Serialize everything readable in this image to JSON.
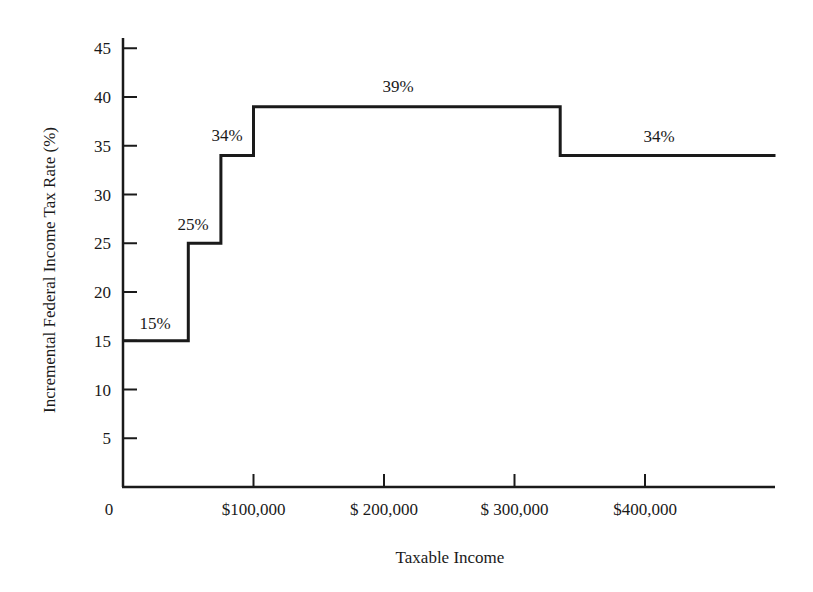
{
  "chart_data": {
    "type": "line",
    "subtype": "step",
    "title": "",
    "xlabel": "Taxable Income",
    "ylabel": "Incremental Federal Income Tax Rate (%)",
    "xlim": [
      0,
      500000
    ],
    "ylim": [
      0,
      47
    ],
    "grid": false,
    "legend": null,
    "x_ticks": [
      {
        "value": 0,
        "label": "0"
      },
      {
        "value": 100000,
        "label": "$100,000"
      },
      {
        "value": 200000,
        "label": "$ 200,000"
      },
      {
        "value": 300000,
        "label": "$ 300,000"
      },
      {
        "value": 400000,
        "label": "$400,000"
      }
    ],
    "y_ticks": [
      5,
      10,
      15,
      20,
      25,
      30,
      35,
      40,
      45
    ],
    "brackets": [
      {
        "from": 0,
        "to": 50000,
        "rate": 15,
        "label": "15%"
      },
      {
        "from": 50000,
        "to": 75000,
        "rate": 25,
        "label": "25%"
      },
      {
        "from": 75000,
        "to": 100000,
        "rate": 34,
        "label": "34%"
      },
      {
        "from": 100000,
        "to": 335000,
        "rate": 39,
        "label": "39%"
      },
      {
        "from": 335000,
        "to": 500000,
        "rate": 34,
        "label": "34%"
      }
    ],
    "x": [
      0,
      50000,
      50000,
      75000,
      75000,
      100000,
      100000,
      335000,
      335000,
      500000
    ],
    "values": [
      15,
      15,
      25,
      25,
      34,
      34,
      39,
      39,
      34,
      34
    ]
  },
  "colors": {
    "line": "#1a1a1a",
    "background": "#ffffff"
  }
}
